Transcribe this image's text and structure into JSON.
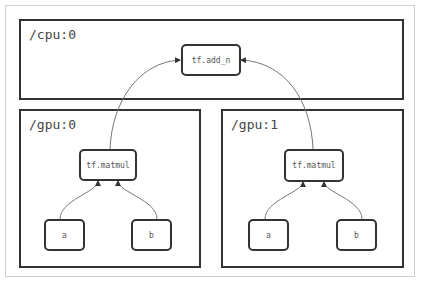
{
  "devices": {
    "cpu": {
      "label": "/cpu:0"
    },
    "gpu0": {
      "label": "/gpu:0"
    },
    "gpu1": {
      "label": "/gpu:1"
    }
  },
  "nodes": {
    "add_n": "tf.add_n",
    "gpu0_matmul": "tf.matmul",
    "gpu0_a": "a",
    "gpu0_b": "b",
    "gpu1_matmul": "tf.matmul",
    "gpu1_a": "a",
    "gpu1_b": "b"
  },
  "edges": [
    {
      "from": "gpu0_matmul",
      "to": "add_n"
    },
    {
      "from": "gpu1_matmul",
      "to": "add_n"
    },
    {
      "from": "gpu0_a",
      "to": "gpu0_matmul"
    },
    {
      "from": "gpu0_b",
      "to": "gpu0_matmul"
    },
    {
      "from": "gpu1_a",
      "to": "gpu1_matmul"
    },
    {
      "from": "gpu1_b",
      "to": "gpu1_matmul"
    }
  ],
  "colors": {
    "border": "#333333",
    "edge": "#777777",
    "frame": "#cfcfcf"
  }
}
